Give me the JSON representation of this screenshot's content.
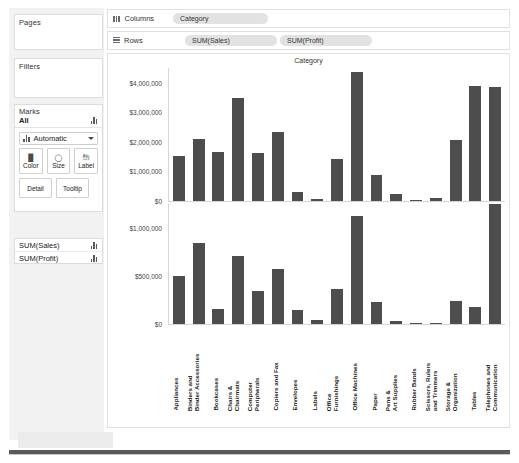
{
  "left_panel": {
    "pages": {
      "title": "Pages"
    },
    "filters": {
      "title": "Filters"
    },
    "marks": {
      "title": "Marks",
      "all_label": "All",
      "type_label": "Automatic",
      "buttons": [
        {
          "name": "color",
          "label": "Color",
          "icon": "palette-icon"
        },
        {
          "name": "size",
          "label": "Size",
          "icon": "size-icon"
        },
        {
          "name": "label",
          "label": "Label",
          "icon": "abc-123-icon"
        },
        {
          "name": "detail",
          "label": "Detail",
          "icon": "detail-icon"
        },
        {
          "name": "tooltip",
          "label": "Tooltip",
          "icon": "tooltip-icon"
        }
      ],
      "abc_top": "Abc",
      "abc_bottom": "123"
    },
    "measures": [
      {
        "label": "SUM(Sales)",
        "icon": "bar-chart-icon"
      },
      {
        "label": "SUM(Profit)",
        "icon": "bar-chart-icon"
      }
    ]
  },
  "shelves": {
    "columns": {
      "label": "Columns",
      "icon": "columns-icon",
      "pills": [
        "Category"
      ]
    },
    "rows": {
      "label": "Rows",
      "icon": "rows-icon",
      "pills": [
        "SUM(Sales)",
        "SUM(Profit)"
      ]
    }
  },
  "viz": {
    "column_header": "Category"
  },
  "chart_data": [
    {
      "type": "bar",
      "title": "Category",
      "xlabel": "",
      "ylabel": "Sales",
      "ylim": [
        0,
        4500000
      ],
      "yticks": [
        0,
        1000000,
        2000000,
        3000000,
        4000000
      ],
      "ytick_labels": [
        "$0",
        "$1,000,000",
        "$2,000,000",
        "$3,000,000",
        "$4,000,000"
      ],
      "grid": false,
      "bar_color": "#4d4d4d",
      "categories": [
        "Appliances",
        "Binders and Binder Accessories",
        "Bookcases",
        "Chairs & Chairmats",
        "Computer Peripherals",
        "Copiers and Fax",
        "Envelopes",
        "Labels",
        "Office Furnishings",
        "Office Machines",
        "Paper",
        "Pens & Art Supplies",
        "Rubber Bands",
        "Scissors, Rulers and Trimmers",
        "Storage & Organization",
        "Tables",
        "Telephones and Communication"
      ],
      "values": [
        1520000,
        2090000,
        1670000,
        3500000,
        1620000,
        2320000,
        300000,
        55000,
        1420000,
        4350000,
        870000,
        240000,
        45000,
        100000,
        2080000,
        3890000,
        3850000
      ]
    },
    {
      "type": "bar",
      "title": "",
      "xlabel": "Category",
      "ylabel": "Profit",
      "ylim": [
        0,
        1250000
      ],
      "yticks": [
        0,
        500000,
        1000000
      ],
      "ytick_labels": [
        "$0",
        "$500,000",
        "$1,000,000"
      ],
      "grid": false,
      "bar_color": "#4d4d4d",
      "categories": [
        "Appliances",
        "Binders and Binder Accessories",
        "Bookcases",
        "Chairs & Chairmats",
        "Computer Peripherals",
        "Copiers and Fax",
        "Envelopes",
        "Labels",
        "Office Furnishings",
        "Office Machines",
        "Paper",
        "Pens & Art Supplies",
        "Rubber Bands",
        "Scissors, Rulers and Trimmers",
        "Storage & Organization",
        "Tables",
        "Telephones and Communication"
      ],
      "values": [
        495000,
        845000,
        155000,
        705000,
        345000,
        570000,
        145000,
        40000,
        360000,
        1130000,
        225000,
        35000,
        8000,
        10000,
        235000,
        175000,
        1290000
      ]
    }
  ]
}
